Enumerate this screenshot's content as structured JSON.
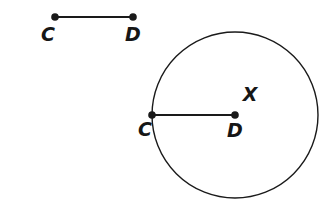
{
  "canvas": {
    "width": 335,
    "height": 217,
    "background": "#ffffff"
  },
  "style": {
    "stroke_color": "#1a1a1a",
    "segment_stroke_width": 2,
    "circle_stroke_width": 1.4,
    "point_radius": 3.8,
    "label_color": "#161616",
    "label_font_size": 19
  },
  "figure": {
    "segment": {
      "name": "segment-CD",
      "start": {
        "label": "C",
        "x": 55,
        "y": 17,
        "label_x": 48,
        "label_y": 41
      },
      "end": {
        "label": "D",
        "x": 133,
        "y": 17,
        "label_x": 133,
        "label_y": 41
      }
    },
    "circle": {
      "name": "circle-X",
      "center_x": 235,
      "center_y": 115,
      "radius": 83,
      "circle_label": {
        "label": "X",
        "x": 250,
        "y": 101
      },
      "center_point": {
        "label": "D",
        "x": 235,
        "y": 115,
        "label_x": 235,
        "label_y": 137
      },
      "radius_point": {
        "label": "C",
        "x": 152,
        "y": 115,
        "label_x": 145,
        "label_y": 136
      },
      "radius_segment": {
        "name": "segment-DC-radius",
        "x1": 152,
        "y1": 115,
        "x2": 235,
        "y2": 115
      }
    }
  }
}
